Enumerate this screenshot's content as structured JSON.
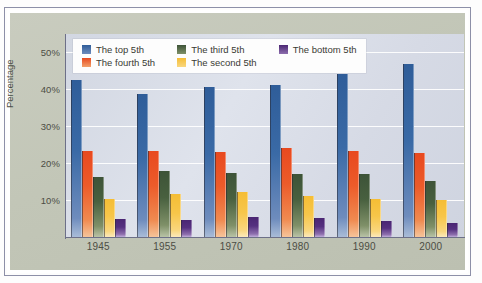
{
  "chart_data": {
    "type": "bar",
    "title": "",
    "subtitle": "",
    "xlabel": "",
    "ylabel": "Percentage",
    "categories": [
      "1945",
      "1955",
      "1970",
      "1980",
      "1990",
      "2000"
    ],
    "ylim": [
      0,
      55
    ],
    "yticks": [
      10,
      20,
      30,
      40,
      50
    ],
    "ytick_labels": [
      "10%",
      "20%",
      "30%",
      "40%",
      "50%"
    ],
    "grid": "horizontal",
    "legend_position": "top-inside",
    "series": [
      {
        "name": "The top 5th",
        "color": "#2f5d99",
        "values": [
          42.5,
          38.8,
          40.7,
          41.2,
          44.2,
          47.0
        ]
      },
      {
        "name": "The fourth 5th",
        "color": "#e8491f",
        "values": [
          23.2,
          23.3,
          23.1,
          24.1,
          23.3,
          22.8
        ]
      },
      {
        "name": "The third 5th",
        "color": "#3d5338",
        "values": [
          16.2,
          17.8,
          17.3,
          17.1,
          17.1,
          15.2
        ]
      },
      {
        "name": "The second 5th",
        "color": "#f5bd35",
        "values": [
          10.4,
          11.7,
          12.1,
          11.1,
          10.4,
          9.9
        ]
      },
      {
        "name": "The bottom 5th",
        "color": "#4a2673",
        "values": [
          4.8,
          4.6,
          5.3,
          5.1,
          4.3,
          3.9
        ]
      }
    ]
  },
  "legend": {
    "items": [
      {
        "label": "The top 5th",
        "swatch": "legend-swatch-top-5th"
      },
      {
        "label": "The third 5th",
        "swatch": "legend-swatch-third-5th"
      },
      {
        "label": "The bottom 5th",
        "swatch": "legend-swatch-bottom-5th"
      },
      {
        "label": "The fourth 5th",
        "swatch": "legend-swatch-fourth-5th"
      },
      {
        "label": "The second 5th",
        "swatch": "legend-swatch-second-5th"
      }
    ]
  },
  "colors": {
    "panel_background": "#c4c8ba",
    "plot_background": "#d8dce7",
    "gridline": "#ffffff",
    "axis": "#6d7088",
    "tick_text": "#4c4d44",
    "panel_border": "#ffffff",
    "outer_border": "#8d90a8"
  }
}
